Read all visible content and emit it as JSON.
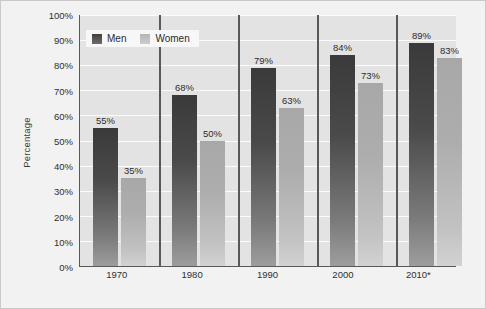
{
  "chart_data": {
    "type": "bar",
    "title": "",
    "subtitle": "",
    "xlabel": "",
    "ylabel": "Percentage",
    "categories": [
      "1970",
      "1980",
      "1990",
      "2000",
      "2010*"
    ],
    "series": [
      {
        "name": "Men",
        "color": "#4a4a4a",
        "values": [
          55,
          68,
          79,
          84,
          89
        ],
        "labels": [
          "55%",
          "68%",
          "79%",
          "84%",
          "89%"
        ]
      },
      {
        "name": "Women",
        "color": "#b4b4b4",
        "values": [
          35,
          50,
          63,
          73,
          83
        ],
        "labels": [
          "35%",
          "50%",
          "63%",
          "73%",
          "83%"
        ]
      }
    ],
    "ylim": [
      0,
      100
    ],
    "ytick_values": [
      0,
      10,
      20,
      30,
      40,
      50,
      60,
      70,
      80,
      90,
      100
    ],
    "ytick_labels": [
      "0%",
      "10%",
      "20%",
      "30%",
      "40%",
      "50%",
      "60%",
      "70%",
      "80%",
      "90%",
      "100%"
    ],
    "grid": true,
    "grid_axis": "y",
    "grid_color": "#fbfbfb",
    "legend_position": "top-left",
    "plot_background": "#e3e3e3",
    "figure_background": "#f2f2f2",
    "axis_color": "#585858"
  },
  "legend": {
    "items": [
      {
        "label": "Men"
      },
      {
        "label": "Women"
      }
    ]
  },
  "axes": {
    "y_title": "Percentage"
  }
}
